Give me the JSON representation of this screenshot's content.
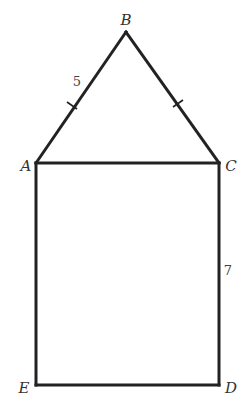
{
  "diagram": {
    "type": "geometry-figure",
    "stroke_color": "#222222",
    "background": "#ffffff",
    "vertices": {
      "A": {
        "label": "A",
        "x": 36,
        "y": 163
      },
      "B": {
        "label": "B",
        "x": 126,
        "y": 32
      },
      "C": {
        "label": "C",
        "x": 219,
        "y": 163
      },
      "D": {
        "label": "D",
        "x": 219,
        "y": 385
      },
      "E": {
        "label": "E",
        "x": 36,
        "y": 385
      }
    },
    "segments": [
      {
        "name": "AB",
        "tick_marks": 1
      },
      {
        "name": "BC",
        "tick_marks": 1
      },
      {
        "name": "AC",
        "tick_marks": 0
      },
      {
        "name": "CD",
        "tick_marks": 0
      },
      {
        "name": "DE",
        "tick_marks": 0
      },
      {
        "name": "EA",
        "tick_marks": 0
      }
    ],
    "measurements": {
      "AB": "5",
      "CD": "7"
    }
  }
}
